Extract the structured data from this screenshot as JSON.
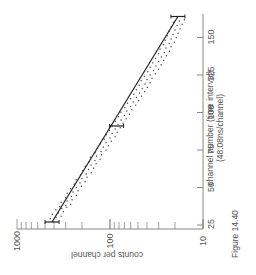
{
  "figure_label": "Figure 14.40",
  "chart_data": {
    "type": "scatter",
    "title": "",
    "orientation": "rotated 90 degrees (channel axis vertical on right, counts axis horizontal at bottom)",
    "xlabel": "channel number (time interval)",
    "xlabel_sub": "(48.08ns/channel)",
    "ylabel": "counts per channel",
    "yscale": "log",
    "xlim": [
      25,
      165
    ],
    "ylim": [
      10,
      1000
    ],
    "x_ticks": [
      "25",
      "50",
      "75",
      "100",
      "125",
      "150"
    ],
    "y_ticks": [
      "10",
      "100",
      "1000"
    ],
    "grid": false,
    "series": [
      {
        "name": "fit line",
        "kind": "line",
        "x": [
          27,
          164
        ],
        "y": [
          420,
          18.6
        ]
      },
      {
        "name": "error bars",
        "kind": "errorbar",
        "x": [
          27,
          91,
          164
        ],
        "y": [
          420,
          85,
          18.6
        ]
      },
      {
        "name": "data",
        "kind": "scatter",
        "x": [
          30,
          33,
          36,
          38,
          41,
          44,
          47,
          50,
          53,
          56,
          59,
          62,
          65,
          68,
          71,
          74,
          77,
          80,
          83,
          86,
          89,
          92,
          95,
          98,
          101,
          104,
          107,
          110,
          113,
          116,
          119,
          122,
          125,
          128,
          131,
          134,
          137,
          140,
          143,
          146,
          149,
          152,
          155,
          158,
          161
        ],
        "y": [
          380,
          360,
          330,
          300,
          290,
          260,
          250,
          230,
          210,
          200,
          180,
          170,
          160,
          145,
          140,
          125,
          118,
          110,
          100,
          95,
          88,
          82,
          76,
          70,
          66,
          60,
          56,
          52,
          48,
          45,
          42,
          40,
          37,
          34,
          32,
          30,
          28,
          26,
          25,
          23,
          22,
          21,
          20,
          19,
          18
        ]
      }
    ]
  }
}
